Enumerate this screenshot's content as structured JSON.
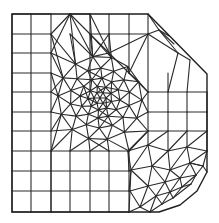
{
  "figure": {
    "colors": {
      "line": "#2a2a2a",
      "background": "#ffffff"
    },
    "boundary": [
      [
        12,
        14
      ],
      [
        148,
        14
      ],
      [
        207,
        74
      ],
      [
        207,
        172
      ],
      [
        197,
        191
      ],
      [
        180,
        205
      ],
      [
        159,
        212
      ],
      [
        12,
        212
      ]
    ],
    "grid": {
      "x": [
        12,
        31,
        51,
        70,
        90,
        109,
        129,
        148,
        168,
        187,
        207
      ],
      "y": [
        14,
        34,
        53,
        73,
        92,
        112,
        131,
        151,
        171,
        191,
        212
      ]
    },
    "refinement_center": [
      100,
      98
    ],
    "notch_center": [
      207,
      212
    ]
  }
}
